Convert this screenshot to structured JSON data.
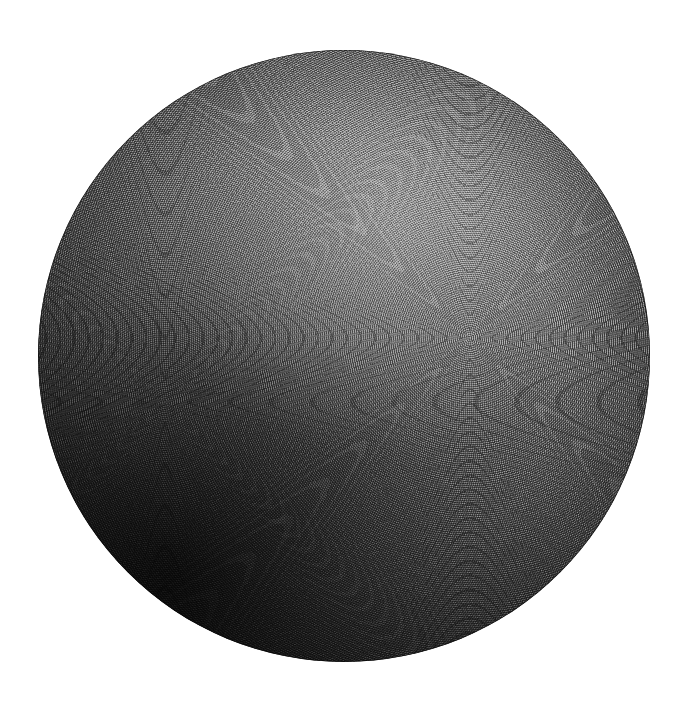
{
  "image": {
    "title": "Shaded sphere engraving",
    "width": 688,
    "height": 719,
    "background_color": "#ffffff",
    "medium": "halftone / moire line engraving",
    "alt_text": "A large dark grey sphere rendered in fine concentric engraving lines on a white background, lit from the upper right and falling to near black at the lower left."
  },
  "sphere": {
    "label": "sphere",
    "center_x": 344,
    "center_y": 356,
    "radius": 306,
    "diameter": 612,
    "fill_base_color": "#3a3a3a",
    "highlight_color": "#8d8d8d",
    "shadow_color": "#090909",
    "rim_color": "#000000",
    "light_direction": "upper-center-right",
    "terminator_direction": "lower-left"
  },
  "texture": {
    "label": "engraving texture",
    "type": "concentric-ring-moire",
    "ring_pitch_px": 2.15,
    "mesh_pitch_px": 1.9,
    "grain": "film-grain noise",
    "foci": [
      {
        "name": "primary-moire-focus",
        "x": 470,
        "y": 338,
        "description": "dominant concentric ring convergence point right of centre"
      },
      {
        "name": "secondary-moire-focus",
        "x": 165,
        "y": 402,
        "description": "weaker concentric ring convergence point on the left flank"
      }
    ]
  },
  "tonal_scale": {
    "label": "tonal range",
    "lightest": "#8d8d8d",
    "darkest": "#090909",
    "background": "#ffffff"
  }
}
